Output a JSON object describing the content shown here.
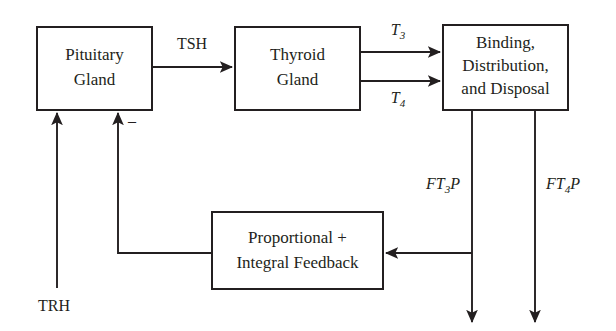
{
  "diagram": {
    "type": "block-diagram",
    "canvas": {
      "width": 616,
      "height": 331
    },
    "colors": {
      "background": "#ffffff",
      "stroke": "#231f20",
      "text": "#231f20"
    },
    "blocks": [
      {
        "id": "pituitary",
        "lines": [
          "Pituitary",
          "Gland"
        ],
        "line1": "Pituitary",
        "line2": "Gland",
        "x": 37,
        "y": 27,
        "width": 115,
        "height": 83
      },
      {
        "id": "thyroid",
        "lines": [
          "Thyroid",
          "Gland"
        ],
        "line1": "Thyroid",
        "line2": "Gland",
        "x": 235,
        "y": 27,
        "width": 125,
        "height": 83
      },
      {
        "id": "binding",
        "lines": [
          "Binding,",
          "Distribution,",
          "and Disposal"
        ],
        "line1": "Binding,",
        "line2": "Distribution,",
        "line3": "and Disposal",
        "x": 443,
        "y": 25,
        "width": 125,
        "height": 85
      },
      {
        "id": "feedback",
        "lines": [
          "Proportional +",
          "Integral Feedback"
        ],
        "line1": "Proportional +",
        "line2": "Integral Feedback",
        "x": 212,
        "y": 212,
        "width": 171,
        "height": 77
      }
    ],
    "signals": {
      "tsh": "TSH",
      "trh": "TRH",
      "t3_base": "T",
      "t3_sub": "3",
      "t4_base": "T",
      "t4_sub": "4",
      "ft3p_pre": "FT",
      "ft3p_sub": "3",
      "ft3p_post": "P",
      "ft4p_pre": "FT",
      "ft4p_sub": "4",
      "ft4p_post": "P",
      "negative_sign": "–"
    }
  }
}
